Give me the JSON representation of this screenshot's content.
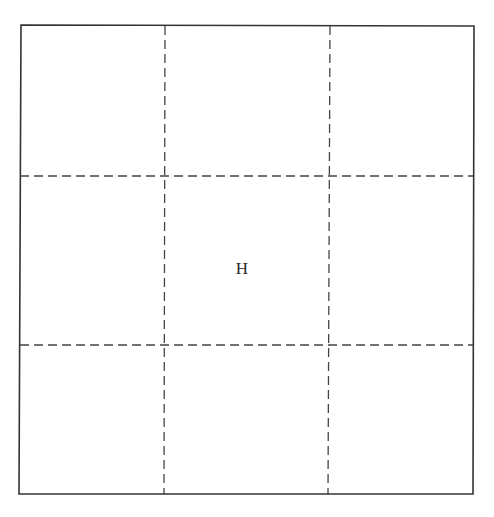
{
  "diagram": {
    "type": "3x3 grid",
    "outer_border": {
      "x1": 20,
      "y1": 25,
      "x2": 473,
      "y2": 494,
      "color": "#333333",
      "style": "solid"
    },
    "vertical_dividers": [
      165,
      329
    ],
    "horizontal_dividers": [
      176,
      345
    ],
    "divider_color": "#444444",
    "divider_style": "dashed",
    "cells": [
      {
        "row": 0,
        "col": 0,
        "label": ""
      },
      {
        "row": 0,
        "col": 1,
        "label": ""
      },
      {
        "row": 0,
        "col": 2,
        "label": ""
      },
      {
        "row": 1,
        "col": 0,
        "label": ""
      },
      {
        "row": 1,
        "col": 1,
        "label": "H"
      },
      {
        "row": 1,
        "col": 2,
        "label": ""
      },
      {
        "row": 2,
        "col": 0,
        "label": ""
      },
      {
        "row": 2,
        "col": 1,
        "label": ""
      },
      {
        "row": 2,
        "col": 2,
        "label": ""
      }
    ],
    "center_label": "H"
  }
}
